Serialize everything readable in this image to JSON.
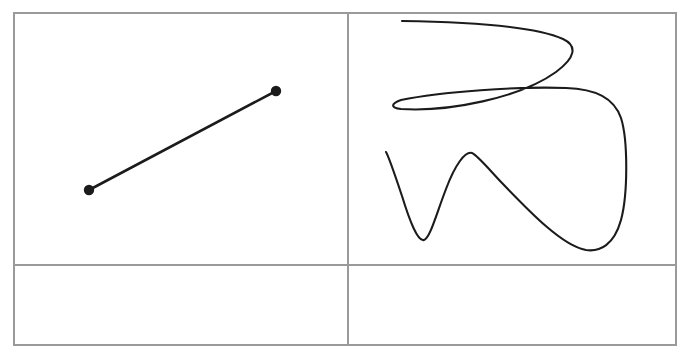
{
  "figure": {
    "background_color": "#ffffff",
    "ink_color": "#1b1b1b",
    "grid_color": "#9a9a9a",
    "width": 690,
    "height": 356
  },
  "grid": {
    "frame": {
      "x": 14,
      "y": 13,
      "width": 662,
      "height": 332
    },
    "columns": 2,
    "rows": 2,
    "vertical_divider_x": 348,
    "horizontal_divider_y": 265,
    "cells": [
      {
        "name": "top-left",
        "content": "line-segment"
      },
      {
        "name": "top-right",
        "content": "freeform-stroke"
      },
      {
        "name": "bottom-left",
        "content": "empty"
      },
      {
        "name": "bottom-right",
        "content": "empty"
      }
    ]
  },
  "chart_data": {
    "type": "scatter",
    "xlabel": "",
    "ylabel": "",
    "xlim": [
      0,
      690
    ],
    "ylim": [
      0,
      356
    ],
    "grid": true,
    "legend": "none",
    "panels": [
      {
        "name": "line-segment-panel",
        "cell": "top-left",
        "shape": "straight-line-with-endpoints",
        "endpoints": [
          {
            "label": "start",
            "x": 89,
            "y": 190
          },
          {
            "label": "end",
            "x": 276,
            "y": 91
          }
        ],
        "endpoint_radius": 5.2,
        "path": "M 89 190 L 276 91"
      },
      {
        "name": "freeform-stroke-panel",
        "cell": "top-right",
        "shape": "continuous-freeform-curve",
        "key_points": [
          {
            "label": "stroke-start",
            "x": 402,
            "y": 21
          },
          {
            "label": "top-right-apex",
            "x": 572,
            "y": 32
          },
          {
            "label": "mid-left-apex",
            "x": 399,
            "y": 109
          },
          {
            "label": "upper-right-shoulder",
            "x": 597,
            "y": 90
          },
          {
            "label": "right-edge-descent",
            "x": 625,
            "y": 150
          },
          {
            "label": "lower-right-valley",
            "x": 585,
            "y": 250
          },
          {
            "label": "wave-peak",
            "x": 473,
            "y": 153
          },
          {
            "label": "wave-valley",
            "x": 424,
            "y": 240
          },
          {
            "label": "stroke-end",
            "x": 386,
            "y": 152
          }
        ],
        "path": "M 402 21 C 470 22 534 26 563 39 C 578 46 575 58 556 72 C 520 98 448 112 401 109 C 391 108 390 104 401 100 C 440 92 520 86 566 88 C 596 89 614 98 621 118 C 628 140 628 194 621 220 C 614 245 600 252 586 250 C 562 246 528 210 502 183 C 487 167 477 155 472 153 C 465 151 455 165 446 189 C 436 215 430 238 424 240 C 418 242 410 222 402 196 C 394 172 389 157 386 152"
      }
    ]
  }
}
